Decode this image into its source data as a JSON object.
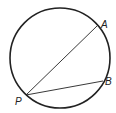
{
  "diagram": {
    "type": "circle-chords",
    "circle": {
      "cx": 60,
      "cy": 58,
      "r": 50
    },
    "points": [
      {
        "label": "A",
        "x": 97,
        "y": 26,
        "lx": 102,
        "ly": 26
      },
      {
        "label": "B",
        "x": 103,
        "y": 81,
        "lx": 106,
        "ly": 85
      },
      {
        "label": "P",
        "x": 26,
        "y": 95,
        "lx": 16,
        "ly": 105
      }
    ],
    "chords": [
      [
        "P",
        "A"
      ],
      [
        "P",
        "B"
      ]
    ],
    "stroke_color": "#222222"
  }
}
